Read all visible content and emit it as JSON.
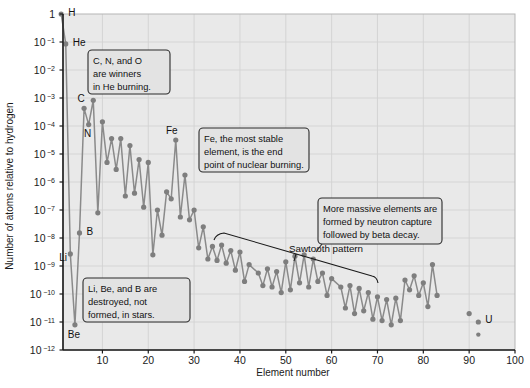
{
  "figure": {
    "background_color": "#ffffff",
    "plot_background_color": "#e9e9e9",
    "grid_color": "#d2d2d2",
    "axis_color": "#1a1a1a",
    "marker_color": "#7e7e7e",
    "line_color": "#8a8a8a",
    "annotation_fill": "#e3e3e3",
    "annotation_border": "#2b2b2b"
  },
  "chart_data": {
    "type": "scatter",
    "title": "",
    "xlabel": "Element number",
    "ylabel": "Number of atoms relative to hydrogen",
    "xlim": [
      1.4,
      100
    ],
    "ylim_log10": [
      -12,
      0
    ],
    "grid": true,
    "legend": "none",
    "xticks": [
      10,
      20,
      30,
      40,
      50,
      60,
      70,
      80,
      90,
      100
    ],
    "xtick_labels": [
      "10",
      "20",
      "30",
      "40",
      "50",
      "60",
      "70",
      "80",
      "90",
      "100"
    ],
    "yticks_log10": [
      0,
      -1,
      -2,
      -3,
      -4,
      -5,
      -6,
      -7,
      -8,
      -9,
      -10,
      -11,
      -12
    ],
    "ytick_labels": [
      "1",
      "10−1",
      "10−2",
      "10−3",
      "10−4",
      "10−5",
      "10−6",
      "10−7",
      "10−8",
      "10−9",
      "10−10",
      "10−11",
      "10−12"
    ],
    "x": [
      1,
      2,
      3,
      4,
      5,
      6,
      7,
      8,
      9,
      10,
      11,
      12,
      13,
      14,
      15,
      16,
      17,
      18,
      19,
      20,
      21,
      22,
      23,
      24,
      25,
      26,
      27,
      28,
      29,
      30,
      31,
      32,
      33,
      34,
      35,
      36,
      37,
      38,
      39,
      40,
      41,
      42,
      44,
      45,
      46,
      47,
      48,
      49,
      50,
      51,
      52,
      53,
      54,
      55,
      56,
      57,
      58,
      59,
      60,
      62,
      63,
      64,
      65,
      66,
      67,
      68,
      69,
      70,
      71,
      72,
      73,
      74,
      75,
      76,
      77,
      78,
      79,
      80,
      81,
      82,
      83,
      90,
      92
    ],
    "values_log10": [
      0.0,
      -1.07,
      -8.57,
      -11.1,
      -7.82,
      -3.37,
      -3.95,
      -3.08,
      -7.1,
      -3.85,
      -5.3,
      -4.45,
      -5.55,
      -4.45,
      -6.5,
      -4.7,
      -6.4,
      -5.2,
      -6.9,
      -5.3,
      -8.6,
      -7.0,
      -7.9,
      -6.35,
      -6.6,
      -4.5,
      -7.25,
      -5.75,
      -7.35,
      -7.0,
      -8.35,
      -7.6,
      -8.75,
      -8.3,
      -8.8,
      -8.25,
      -8.9,
      -8.45,
      -9.15,
      -8.5,
      -9.55,
      -8.95,
      -9.25,
      -9.7,
      -9.1,
      -9.75,
      -9.2,
      -9.95,
      -8.85,
      -9.85,
      -8.65,
      -9.6,
      -8.6,
      -9.75,
      -8.75,
      -9.55,
      -9.25,
      -10.05,
      -9.45,
      -9.75,
      -10.5,
      -9.7,
      -10.7,
      -9.8,
      -10.6,
      -9.95,
      -10.9,
      -10.1,
      -10.95,
      -10.2,
      -11.1,
      -10.15,
      -10.95,
      -9.5,
      -9.85,
      -9.35,
      -10.05,
      -9.6,
      -10.45,
      -8.95,
      -10.05,
      -10.7,
      -11.0
    ],
    "series_name": "Solar system elemental abundance"
  },
  "point_labels": [
    {
      "text": "H",
      "element": 1
    },
    {
      "text": "He",
      "element": 2
    },
    {
      "text": "C",
      "element": 6
    },
    {
      "text": "N",
      "element": 7
    },
    {
      "text": "O",
      "element": 8
    },
    {
      "text": "Li",
      "element": 3
    },
    {
      "text": "Be",
      "element": 4
    },
    {
      "text": "B",
      "element": 5
    },
    {
      "text": "Fe",
      "element": 26
    },
    {
      "text": "U",
      "element": 92
    }
  ],
  "annotations": [
    {
      "name": "cno-annotation",
      "lines": [
        "C, N, and O",
        "are winners",
        "in He burning."
      ]
    },
    {
      "name": "iron-annotation",
      "lines": [
        "Fe, the most stable",
        "element, is the end",
        "point of nuclear burning."
      ]
    },
    {
      "name": "neutron-capture-annotation",
      "lines": [
        "More massive elements are",
        "formed by neutron capture",
        "followed by beta decay."
      ]
    },
    {
      "name": "light-element-annotation",
      "lines": [
        "Li, Be, and B are",
        "destroyed, not",
        "formed, in stars."
      ]
    }
  ],
  "callouts": [
    {
      "name": "sawtooth-callout",
      "text": "Sawtooth pattern"
    }
  ]
}
